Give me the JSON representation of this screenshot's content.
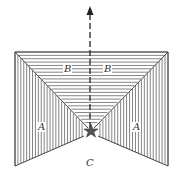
{
  "figure": {
    "labels": {
      "ceiling_left": "B",
      "ceiling_right": "B",
      "wall_left": "A",
      "wall_right": "A",
      "floor": "C"
    },
    "arrow": {
      "direction": "up",
      "style": "dashed"
    },
    "vanishing_point_mark": "star",
    "colors": {
      "line": "#555555",
      "background": "#ffffff"
    }
  }
}
